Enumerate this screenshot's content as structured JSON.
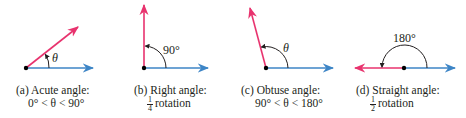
{
  "colors": {
    "red_ray": "#e8336e",
    "blue_ray": "#3d85c6",
    "arc": "#231f20",
    "vertex": "#000000"
  },
  "panels": [
    {
      "id": "a",
      "caption_line1": "(a) Acute angle:",
      "caption_line2": "0° < θ < 90°",
      "angle_label": "θ"
    },
    {
      "id": "b",
      "caption_line1": "(b) Right angle:",
      "caption_frac_num": "1",
      "caption_frac_den": "4",
      "caption_line2_rest": "rotation",
      "angle_label": "90°"
    },
    {
      "id": "c",
      "caption_line1": "(c) Obtuse angle:",
      "caption_line2": "90° < θ < 180°",
      "angle_label": "θ"
    },
    {
      "id": "d",
      "caption_line1": "(d) Straight angle:",
      "caption_frac_num": "1",
      "caption_frac_den": "2",
      "caption_line2_rest": "rotation",
      "angle_label": "180°"
    }
  ]
}
